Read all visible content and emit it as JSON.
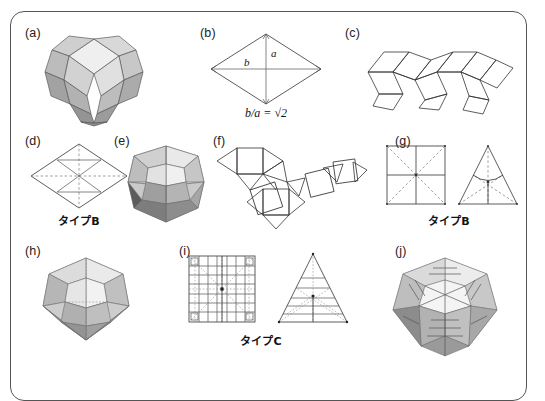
{
  "figure": {
    "kind": "scientific-figure",
    "background": "#ffffff",
    "frame_color": "#555555"
  },
  "panels": [
    {
      "id": "a",
      "letter": "(a)",
      "content": "rhombic-dodecahedron-3d",
      "caption": ""
    },
    {
      "id": "b",
      "letter": "(b)",
      "content": "rhombus-with-diagonals",
      "caption": "b/a = √2",
      "labels": {
        "vertical_diagonal": "a",
        "horizontal_diagonal": "b"
      }
    },
    {
      "id": "c",
      "letter": "(c)",
      "content": "rhombic-net-zigzag",
      "caption": ""
    },
    {
      "id": "d",
      "letter": "(d)",
      "content": "rhombus-crease-pattern",
      "caption": "タイプB"
    },
    {
      "id": "e",
      "letter": "(e)",
      "content": "folded-rhombic-solid-3d",
      "caption": ""
    },
    {
      "id": "f",
      "letter": "(f)",
      "content": "square-triangle-net",
      "caption": ""
    },
    {
      "id": "g",
      "letter": "(g)",
      "content": "square-and-triangle-crease-pattern",
      "caption": "タイプB"
    },
    {
      "id": "h",
      "letter": "(h)",
      "content": "folded-cuboctahedron-3d",
      "caption": ""
    },
    {
      "id": "i",
      "letter": "(i)",
      "content": "square-and-triangle-pleated-crease-pattern",
      "caption": "タイプC"
    },
    {
      "id": "j",
      "letter": "(j)",
      "content": "folded-pleated-polyhedron-3d",
      "caption": ""
    }
  ],
  "colors": {
    "line": "#333333",
    "dashed": "#777777",
    "shade_light": "#e8e8e8",
    "shade_mid": "#c4c4c4",
    "shade_dark": "#9a9a9a",
    "shade_darker": "#777777"
  }
}
